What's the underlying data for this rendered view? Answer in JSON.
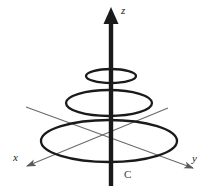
{
  "figure": {
    "background_color": "#ffffff",
    "width": 214,
    "height": 195
  },
  "axes": {
    "z": {
      "label": "z",
      "color": "#1a1a1a",
      "direction": "up",
      "arrow": true,
      "shaft_width": 4,
      "x1": 111,
      "y1": 186,
      "x2": 111,
      "y2": 20,
      "label_x": 121,
      "label_y": 13
    },
    "x": {
      "label": "x",
      "color": "#6a6a6a",
      "direction": "down-left",
      "arrow": true,
      "x1": 168,
      "y1": 108,
      "x2": 22,
      "y2": 168,
      "label_x": 17,
      "label_y": 160
    },
    "y": {
      "label": "y",
      "color": "#6a6a6a",
      "direction": "down-right",
      "arrow": true,
      "x1": 26,
      "y1": 107,
      "x2": 198,
      "y2": 170,
      "label_x": 195,
      "label_y": 162
    }
  },
  "circles": [
    {
      "name": "top-circle",
      "cx": 111,
      "cy": 76,
      "rx": 25,
      "ry": 7,
      "stroke": "#1a1a1a",
      "stroke_width": 2.2
    },
    {
      "name": "middle-circle",
      "cx": 109,
      "cy": 103,
      "rx": 43,
      "ry": 13,
      "stroke": "#1a1a1a",
      "stroke_width": 2.2
    },
    {
      "name": "bottom-circle",
      "cx": 109,
      "cy": 141,
      "rx": 68,
      "ry": 21,
      "stroke": "#1a1a1a",
      "stroke_width": 2.2
    }
  ],
  "annotations": [
    {
      "name": "curve-label-c",
      "text": "C",
      "x": 126,
      "y": 176,
      "color": "#3a3a3a"
    }
  ]
}
